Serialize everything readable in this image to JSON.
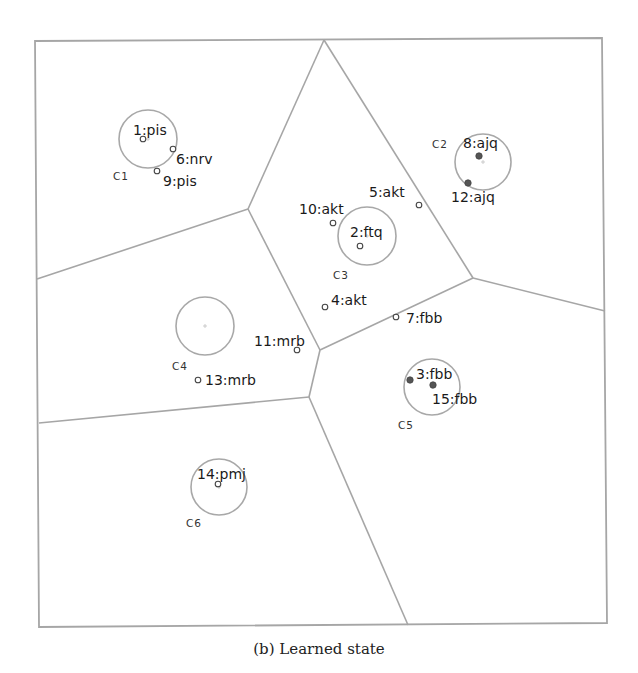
{
  "caption": "(b) Learned state",
  "colors": {
    "edge": "#a6a6a6",
    "circle": "#a8a8a8",
    "point_open": "#444444",
    "point_filled": "#555555",
    "text": "#1a1a1a"
  },
  "clusters": [
    {
      "id": "C1",
      "label": "C1",
      "cx": 148,
      "cy": 139,
      "r": 29,
      "label_x": 113,
      "label_y": 180
    },
    {
      "id": "C2",
      "label": "C2",
      "cx": 483,
      "cy": 162,
      "r": 28,
      "label_x": 432,
      "label_y": 148
    },
    {
      "id": "C3",
      "label": "C3",
      "cx": 367,
      "cy": 236,
      "r": 29,
      "label_x": 333,
      "label_y": 279
    },
    {
      "id": "C4",
      "label": "C4",
      "cx": 205,
      "cy": 326,
      "r": 29,
      "label_x": 172,
      "label_y": 370
    },
    {
      "id": "C5",
      "label": "C5",
      "cx": 432,
      "cy": 387,
      "r": 28,
      "label_x": 398,
      "label_y": 429
    },
    {
      "id": "C6",
      "label": "C6",
      "cx": 219,
      "cy": 487,
      "r": 28,
      "label_x": 186,
      "label_y": 527
    }
  ],
  "points": [
    {
      "id": 1,
      "label": "1:pis",
      "x": 143,
      "y": 139,
      "filled": false,
      "lx": 133,
      "ly": 135
    },
    {
      "id": 2,
      "label": "2:ftq",
      "x": 360,
      "y": 246,
      "filled": false,
      "lx": 350,
      "ly": 237
    },
    {
      "id": 3,
      "label": "3:fbb",
      "x": 410,
      "y": 380,
      "filled": true,
      "lx": 416,
      "ly": 379
    },
    {
      "id": 4,
      "label": "4:akt",
      "x": 325,
      "y": 307,
      "filled": false,
      "lx": 331,
      "ly": 305
    },
    {
      "id": 5,
      "label": "5:akt",
      "x": 419,
      "y": 205,
      "filled": false,
      "lx": 369,
      "ly": 197
    },
    {
      "id": 6,
      "label": "6:nrv",
      "x": 173,
      "y": 149,
      "filled": false,
      "lx": 176,
      "ly": 164
    },
    {
      "id": 7,
      "label": "7:fbb",
      "x": 396,
      "y": 317,
      "filled": false,
      "lx": 406,
      "ly": 323
    },
    {
      "id": 8,
      "label": "8:ajq",
      "x": 479,
      "y": 156,
      "filled": true,
      "lx": 463,
      "ly": 148
    },
    {
      "id": 9,
      "label": "9:pis",
      "x": 157,
      "y": 171,
      "filled": false,
      "lx": 163,
      "ly": 186
    },
    {
      "id": 10,
      "label": "10:akt",
      "x": 333,
      "y": 223,
      "filled": false,
      "lx": 299,
      "ly": 214
    },
    {
      "id": 11,
      "label": "11:mrb",
      "x": 297,
      "y": 350,
      "filled": false,
      "lx": 254,
      "ly": 346
    },
    {
      "id": 12,
      "label": "12:ajq",
      "x": 468,
      "y": 183,
      "filled": true,
      "lx": 451,
      "ly": 202
    },
    {
      "id": 13,
      "label": "13:mrb",
      "x": 198,
      "y": 380,
      "filled": false,
      "lx": 205,
      "ly": 385
    },
    {
      "id": 14,
      "label": "14:pmj",
      "x": 218,
      "y": 484,
      "filled": false,
      "lx": 197,
      "ly": 479
    },
    {
      "id": 15,
      "label": "15:fbb",
      "x": 433,
      "y": 385,
      "filled": true,
      "lx": 432,
      "ly": 404
    }
  ],
  "frame": {
    "tl": [
      35,
      41
    ],
    "tr": [
      602,
      38
    ],
    "br": [
      607,
      623
    ],
    "bl": [
      39,
      627
    ]
  },
  "vertices": {
    "top": [
      324,
      40
    ],
    "junction_left_upper": [
      248,
      209
    ],
    "junction_right": [
      473,
      278
    ],
    "junction_mid": [
      320,
      350
    ],
    "junction_lower": [
      309,
      397
    ],
    "left_upper_end": [
      37,
      279
    ],
    "left_lower_end": [
      39,
      423
    ],
    "right_end": [
      605,
      311
    ],
    "bottom_end": [
      408,
      625
    ]
  }
}
